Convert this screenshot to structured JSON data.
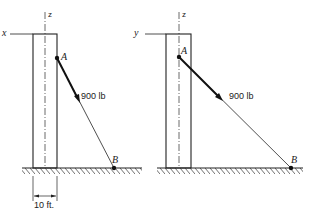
{
  "figures": [
    {
      "name": "left",
      "horizontal_axis": "x",
      "vertical_axis": "z",
      "point_a": "A",
      "point_b": "B",
      "force_label": "900 lb",
      "dimension_label": "10 ft."
    },
    {
      "name": "right",
      "horizontal_axis": "y",
      "vertical_axis": "z",
      "point_a": "A",
      "point_b": "B",
      "force_label": "900 lb"
    }
  ]
}
